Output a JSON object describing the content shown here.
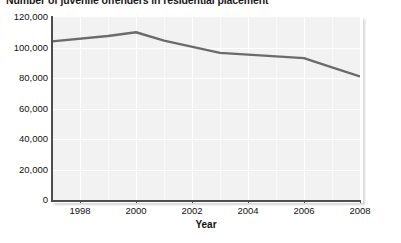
{
  "chart_data": {
    "type": "line",
    "title": "Number of juvenile offenders in residential placement",
    "xlabel": "Year",
    "ylabel": "",
    "xlim": [
      1997,
      2008
    ],
    "ylim": [
      0,
      120000
    ],
    "grid": true,
    "legend": "none",
    "line_color": "#6b6b6b",
    "plot_background": "#f2f2f2",
    "x": [
      1997,
      1999,
      2000,
      2001,
      2003,
      2006,
      2007,
      2008
    ],
    "values": [
      104000,
      107500,
      110000,
      104500,
      96500,
      93000,
      87000,
      81000
    ],
    "series": [
      {
        "name": "Juvenile offenders in residential placement",
        "values": [
          104000,
          107500,
          110000,
          104500,
          96500,
          93000,
          87000,
          81000
        ]
      }
    ],
    "y_ticks": [
      {
        "value": 120000,
        "label": "120,000"
      },
      {
        "value": 100000,
        "label": "100,000"
      },
      {
        "value": 80000,
        "label": "80,000"
      },
      {
        "value": 60000,
        "label": "60,000"
      },
      {
        "value": 40000,
        "label": "40,000"
      },
      {
        "value": 20000,
        "label": "20,000"
      },
      {
        "value": 0,
        "label": "0"
      }
    ],
    "x_ticks": [
      {
        "value": 1998,
        "label": "1998"
      },
      {
        "value": 2000,
        "label": "2000"
      },
      {
        "value": 2002,
        "label": "2002"
      },
      {
        "value": 2004,
        "label": "2004"
      },
      {
        "value": 2006,
        "label": "2006"
      },
      {
        "value": 2008,
        "label": "2008"
      }
    ]
  },
  "caption": {
    "text": ""
  }
}
